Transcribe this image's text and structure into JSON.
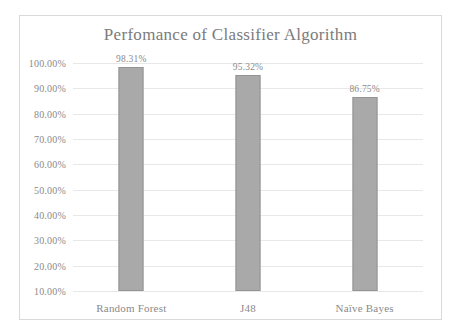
{
  "chart_data": {
    "type": "bar",
    "title": "Perfomance  of Classifier Algorithm",
    "xlabel": "",
    "ylabel": "",
    "categories": [
      "Random Forest",
      "J48",
      "Naïve Bayes"
    ],
    "values": [
      98.31,
      95.32,
      86.75
    ],
    "value_labels": [
      "98.31%",
      "95.32%",
      "86.75%"
    ],
    "ylim": [
      10,
      100
    ],
    "ytick_values": [
      10,
      20,
      30,
      40,
      50,
      60,
      70,
      80,
      90,
      100
    ],
    "ytick_labels": [
      "10.00%",
      "20.00%",
      "30.00%",
      "40.00%",
      "50.00%",
      "60.00%",
      "70.00%",
      "80.00%",
      "90.00%",
      "100.00%"
    ],
    "grid": true,
    "legend": false,
    "legend_position": "none",
    "series": [
      {
        "name": "Accuracy",
        "values": [
          98.31,
          95.32,
          86.75
        ]
      }
    ],
    "colors": {
      "bar_fill": "#a9a9a9",
      "bar_border": "#949494",
      "gridline": "#e8e8e8",
      "text": "#8a8a8a",
      "title_text": "#7b7b7b",
      "frame_border": "#d9d9d9",
      "background": "#ffffff"
    }
  }
}
